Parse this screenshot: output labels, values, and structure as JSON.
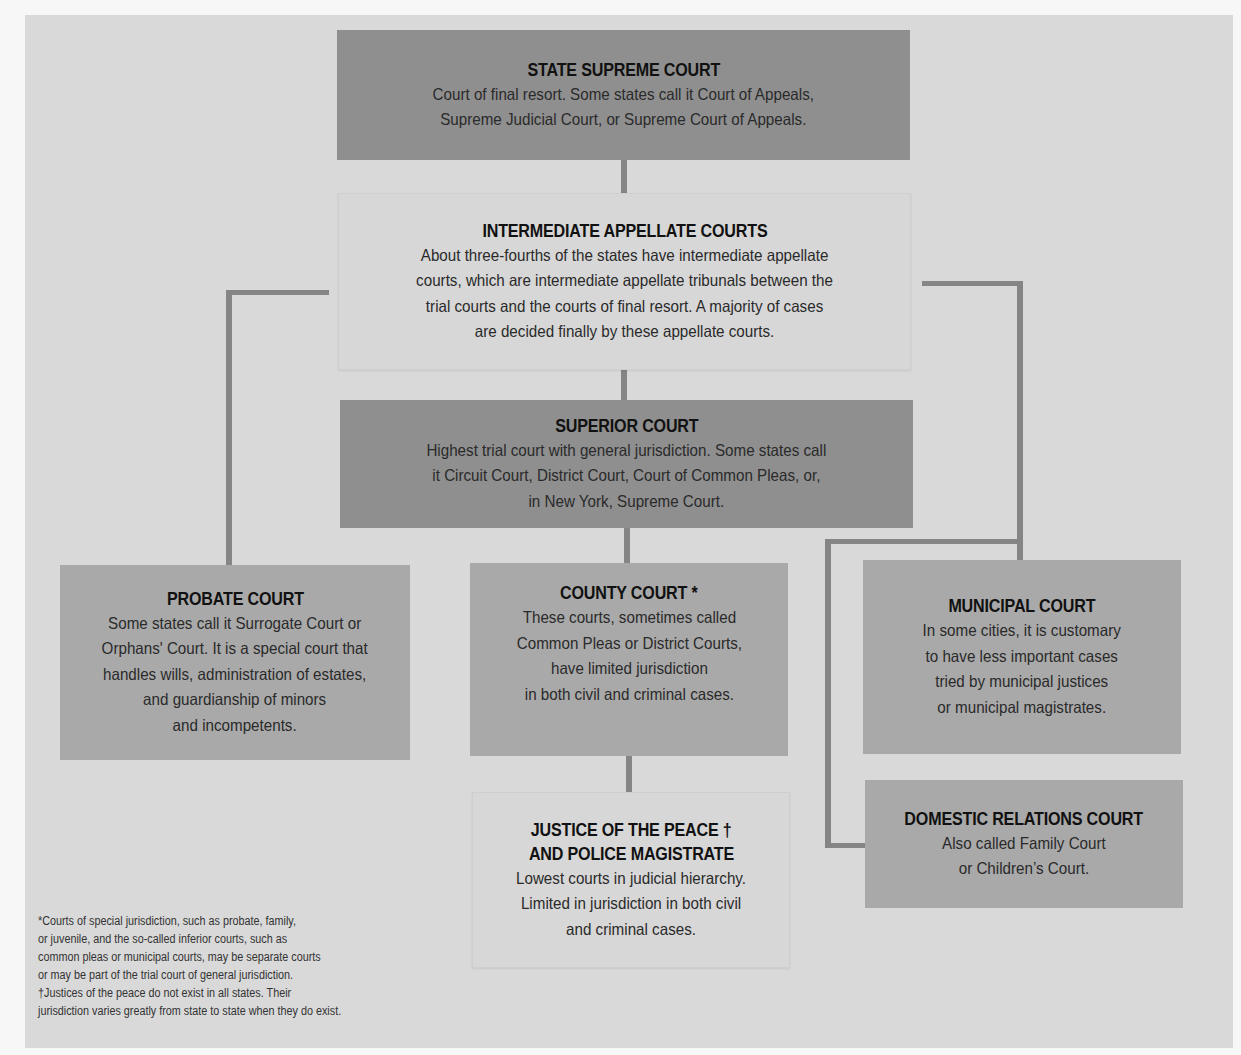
{
  "diagram": {
    "type": "hierarchy"
  },
  "nodes": {
    "supreme": {
      "title": "STATE SUPREME COURT",
      "desc": "Court of final resort. Some states call it Court of Appeals,\nSupreme Judicial Court, or Supreme Court of Appeals."
    },
    "appellate": {
      "title": "INTERMEDIATE APPELLATE COURTS",
      "desc": "About three-fourths of the states have intermediate appellate\ncourts, which are intermediate appellate tribunals between the\ntrial courts and the courts of final resort. A majority of cases\nare decided finally by these appellate courts."
    },
    "superior": {
      "title": "SUPERIOR COURT",
      "desc": "Highest trial court with general jurisdiction. Some states call\nit Circuit Court, District Court, Court of Common Pleas, or,\nin New York, Supreme Court."
    },
    "probate": {
      "title": "PROBATE COURT",
      "desc": "Some states call it Surrogate Court or\nOrphans' Court. It is a special court that\nhandles wills, administration of estates,\nand guardianship of minors\nand incompetents."
    },
    "county": {
      "title": "COUNTY COURT *",
      "desc": "These courts, sometimes called\nCommon Pleas or District Courts,\nhave limited jurisdiction\nin both civil and criminal cases."
    },
    "municipal": {
      "title": "MUNICIPAL COURT",
      "desc": "In some cities, it is customary\nto have less important cases\ntried by municipal justices\nor municipal magistrates."
    },
    "justice": {
      "title_line1": "JUSTICE OF THE PEACE †",
      "title_line2": "AND POLICE MAGISTRATE",
      "desc": "Lowest courts in judicial hierarchy.\nLimited in jurisdiction in both civil\nand criminal cases."
    },
    "domestic": {
      "title": "DOMESTIC RELATIONS COURT",
      "desc": "Also called Family Court\nor Children’s Court."
    }
  },
  "edges": [
    [
      "supreme",
      "appellate"
    ],
    [
      "appellate",
      "superior"
    ],
    [
      "appellate",
      "probate"
    ],
    [
      "appellate",
      "municipal"
    ],
    [
      "superior",
      "county"
    ],
    [
      "superior",
      "domestic"
    ],
    [
      "county",
      "justice"
    ]
  ],
  "footnote": "*Courts of special jurisdiction, such as probate, family,\nor juvenile, and the so-called inferior courts, such as\ncommon pleas or municipal courts, may be separate courts\nor may be part of the trial court of general jurisdiction.\n†Justices of the peace do not exist in all states. Their\njurisdiction varies greatly from state to state when they do exist.",
  "colors": {
    "background": "#d9d9d9",
    "dark_box": "#8f8f8f",
    "mid_box": "#a9a9a9",
    "light_box": "#d7d7d7",
    "connector": "#858585"
  }
}
